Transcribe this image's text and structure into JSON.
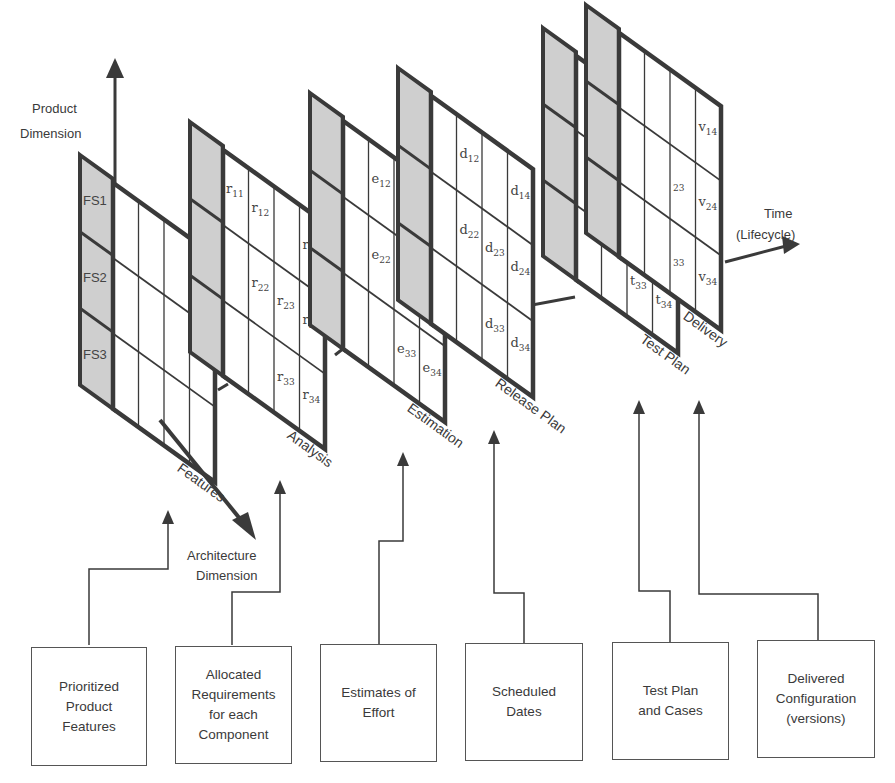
{
  "colors": {
    "frame": "#3a3a3a",
    "header_fill": "#cfcfcf",
    "grid_line": "#3a3a3a",
    "background": "#ffffff"
  },
  "axes": {
    "product": {
      "label_line1": "Product",
      "label_line2": "Dimension"
    },
    "architecture": {
      "label_line1": "Architecture",
      "label_line2": "Dimension"
    },
    "time": {
      "label_line1": "Time",
      "label_line2": "(Lifecycle)"
    }
  },
  "panels": [
    {
      "id": "features",
      "label": "Features",
      "row_labels": [
        "FS1",
        "FS2",
        "FS3"
      ],
      "cells": []
    },
    {
      "id": "analysis",
      "label": "Analysis",
      "row_labels": [],
      "cells": [
        {
          "sym": "r",
          "sub": "11"
        },
        {
          "sym": "r",
          "sub": "12"
        },
        {
          "sym": "r",
          "sub": "14"
        },
        {
          "sym": "r",
          "sub": "22"
        },
        {
          "sym": "r",
          "sub": "23"
        },
        {
          "sym": "r",
          "sub": "24"
        },
        {
          "sym": "r",
          "sub": "33"
        },
        {
          "sym": "r",
          "sub": "34"
        }
      ]
    },
    {
      "id": "estimation",
      "label": "Estimation",
      "row_labels": [],
      "cells": [
        {
          "sym": "e",
          "sub": "12"
        },
        {
          "sym": "e",
          "sub": "14"
        },
        {
          "sym": "e",
          "sub": "22"
        },
        {
          "sym": "e",
          "sub": "23"
        },
        {
          "sym": "e",
          "sub": "24"
        },
        {
          "sym": "e",
          "sub": "33"
        },
        {
          "sym": "e",
          "sub": "34"
        }
      ]
    },
    {
      "id": "release-plan",
      "label": "Release Plan",
      "row_labels": [],
      "cells": [
        {
          "sym": "d",
          "sub": "12"
        },
        {
          "sym": "d",
          "sub": "14"
        },
        {
          "sym": "d",
          "sub": "22"
        },
        {
          "sym": "d",
          "sub": "23"
        },
        {
          "sym": "d",
          "sub": "24"
        },
        {
          "sym": "d",
          "sub": "33"
        },
        {
          "sym": "d",
          "sub": "34"
        }
      ]
    },
    {
      "id": "test-plan",
      "label": "Test Plan",
      "row_labels": [],
      "cells": [
        {
          "sym": "t",
          "sub": "12"
        },
        {
          "sym": "t",
          "sub": "14"
        },
        {
          "sym": "t",
          "sub": "22"
        },
        {
          "sym": "t",
          "sub": "23"
        },
        {
          "sym": "t",
          "sub": "24"
        },
        {
          "sym": "t",
          "sub": "33"
        },
        {
          "sym": "t",
          "sub": "34"
        }
      ]
    },
    {
      "id": "delivery",
      "label": "Delivery",
      "row_labels": [],
      "cells": [
        {
          "sym": "v",
          "sub": "14"
        },
        {
          "sym": "v",
          "sub": "24"
        },
        {
          "sym": "v",
          "sub": "34"
        },
        {
          "sym": "",
          "sub": "23"
        },
        {
          "sym": "",
          "sub": "33"
        }
      ]
    }
  ],
  "boxes": [
    {
      "id": "prioritized-product-features",
      "text": "Prioritized\nProduct\nFeatures"
    },
    {
      "id": "allocated-requirements",
      "text": "Allocated\nRequirements\nfor each\nComponent"
    },
    {
      "id": "estimates-of-effort",
      "text": "Estimates of\nEffort"
    },
    {
      "id": "scheduled-dates",
      "text": "Scheduled\nDates"
    },
    {
      "id": "test-plan-and-cases",
      "text": "Test Plan\nand Cases"
    },
    {
      "id": "delivered-configuration",
      "text": "Delivered\nConfiguration\n(versions)"
    }
  ]
}
